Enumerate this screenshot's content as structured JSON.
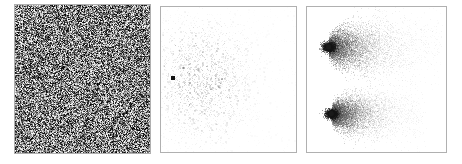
{
  "figure": {
    "title": "",
    "background_color": "#ffffff",
    "border_color": "#b0b0b0",
    "panel_count": 3,
    "layout": "three horizontal square panels"
  },
  "panels": [
    {
      "name": "uniform-noise",
      "label": "",
      "description": "Dense uniform grayscale salt-and-pepper noise filling the entire square",
      "x": 14,
      "y": 4,
      "width": 137,
      "height": 150
    },
    {
      "name": "sparse-scatter",
      "label": "",
      "description": "Nearly white field with a faint diffuse cloud of sparse gray speckles and one dark square point at left of center",
      "x": 160,
      "y": 6,
      "width": 137,
      "height": 147
    },
    {
      "name": "double-comet",
      "label": "",
      "description": "Two comet-shaped speckle clouds, each with a dark round head on the left and a tail fading to the right",
      "x": 306,
      "y": 6,
      "width": 141,
      "height": 147
    }
  ],
  "chart_data": {
    "type": "scatter",
    "title": "",
    "xlabel": "",
    "ylabel": "",
    "grid": false,
    "legend": null,
    "colormap": "grayscale",
    "subplots": [
      {
        "id": "panel-noise",
        "type": "heatmap",
        "title": "",
        "xlabel": "",
        "ylabel": "",
        "xlim": [
          0,
          1
        ],
        "ylim": [
          0,
          1
        ],
        "field": "uniform-random",
        "value_min": 0,
        "value_max": 255,
        "mean_gray": 128,
        "pixel_block": 1.4,
        "density": 1.0,
        "notes": "Fully saturated uncorrelated uniform noise, no visible structure"
      },
      {
        "id": "panel-sparse",
        "type": "scatter",
        "title": "",
        "xlabel": "",
        "ylabel": "",
        "xlim": [
          0,
          1
        ],
        "ylim": [
          0,
          1
        ],
        "n_points": 2600,
        "cloud_center": [
          0.3,
          0.5
        ],
        "cloud_sigma_x": 0.2,
        "cloud_sigma_y": 0.22,
        "point_alpha_min": 0.02,
        "point_alpha_max": 0.28,
        "markers": [
          {
            "name": "dark-point",
            "x": 0.088,
            "y": 0.49,
            "size_px": 4,
            "color": "#141414",
            "shape": "square"
          }
        ],
        "notes": "Very low contrast speckle cloud with a single prominent dark square marker"
      },
      {
        "id": "panel-comet",
        "type": "scatter",
        "title": "",
        "xlabel": "",
        "ylabel": "",
        "xlim": [
          0,
          1
        ],
        "ylim": [
          0,
          1
        ],
        "n_points": 14000,
        "clusters": [
          {
            "name": "upper-comet",
            "head_x": 0.155,
            "head_y": 0.275,
            "tail_length": 0.66,
            "head_radius": 0.03,
            "spread_y": 0.075,
            "head_color": "#1a1a1a",
            "peak_alpha": 0.45
          },
          {
            "name": "lower-comet",
            "head_x": 0.175,
            "head_y": 0.735,
            "tail_length": 0.55,
            "head_radius": 0.028,
            "spread_y": 0.06,
            "head_color": "#1a1a1a",
            "peak_alpha": 0.45
          }
        ],
        "notes": "Two horizontally-oriented comet/teardrop point clouds stacked vertically, tails fading toward the right edge"
      }
    ]
  }
}
